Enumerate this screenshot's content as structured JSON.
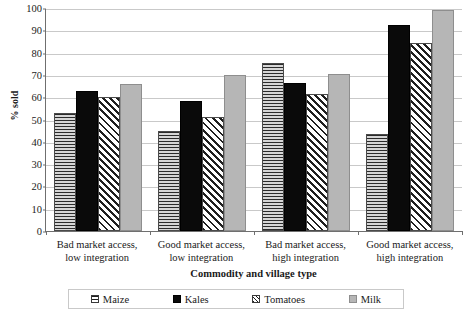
{
  "chart_data": {
    "type": "bar",
    "title": "",
    "xlabel": "Commodity and village type",
    "ylabel": "% sold",
    "ylim": [
      0,
      100
    ],
    "ytick_step": 10,
    "yticks": [
      0,
      10,
      20,
      30,
      40,
      50,
      60,
      70,
      80,
      90,
      100
    ],
    "grid": true,
    "legend_position": "bottom",
    "categories": [
      "Bad market access, low integration",
      "Good market access, low integration",
      "Bad market access, high integration",
      "Good market access, high integration"
    ],
    "category_lines": [
      [
        "Bad market access,",
        "low integration"
      ],
      [
        "Good market access,",
        "low integration"
      ],
      [
        "Bad market access,",
        "high integration"
      ],
      [
        "Good market access,",
        "high integration"
      ]
    ],
    "series": [
      {
        "name": "Maize",
        "pattern": "horizontal-lines",
        "values": [
          53,
          45,
          75.5,
          43.5
        ]
      },
      {
        "name": "Kales",
        "pattern": "solid-black",
        "values": [
          63,
          58.5,
          66.5,
          92.5
        ]
      },
      {
        "name": "Tomatoes",
        "pattern": "diagonal-hatch",
        "values": [
          60,
          51,
          61.5,
          84.5
        ]
      },
      {
        "name": "Milk",
        "pattern": "solid-gray",
        "values": [
          66,
          70,
          70.5,
          99
        ]
      }
    ]
  },
  "axis": {
    "y_title": "% sold",
    "x_title": "Commodity and village type",
    "y_labels": [
      "100",
      "90",
      "80",
      "70",
      "60",
      "50",
      "40",
      "30",
      "20",
      "10",
      "0"
    ]
  },
  "legend": {
    "items": [
      {
        "label": "Maize"
      },
      {
        "label": "Kales"
      },
      {
        "label": "Tomatoes"
      },
      {
        "label": "Milk"
      }
    ]
  },
  "colors": {
    "gridline": "#c9c9c9",
    "axis": "#6f6f6f",
    "kales": "#0a0a0a",
    "milk": "#b6b6b6",
    "maize_base": "#d6d6d6",
    "tomatoes_base": "#ffffff",
    "text": "#1a1a1a"
  }
}
